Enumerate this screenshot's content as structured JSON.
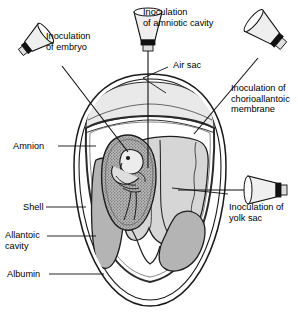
{
  "figure": {
    "type": "anatomical-diagram"
  },
  "colors": {
    "outline": "#1a1a1a",
    "air_sac_fill": "#e8e8e8",
    "yolk_sac_fill": "#d3d3d3",
    "allantoic_fill": "#b0b0b0",
    "amnion_fill": "#a8a8a8",
    "albumin_fill": "#ffffff",
    "shell_fill": "#ffffff",
    "syringe_fill": "#f0f0f0",
    "hub_fill": "#111111",
    "text": "#000000"
  },
  "labels": {
    "inoculation_embryo": {
      "lines": [
        "Inoculation",
        "of embryo"
      ],
      "line1": "Inoculation",
      "line2": "of embryo",
      "x": 46,
      "y": 33
    },
    "inoculation_amniotic": {
      "lines": [
        "Inoculation",
        "of amniotic cavity"
      ],
      "line1": "Inoculation",
      "line2": "of amniotic cavity",
      "x": 143,
      "y": 8
    },
    "air_sac": {
      "text": "Air sac",
      "x": 172,
      "y": 64
    },
    "inoculation_cam": {
      "lines": [
        "Inoculation of",
        "chorioallantoic",
        "membrane"
      ],
      "line1": "Inoculation of",
      "line2": "chorioallantoic",
      "line3": "membrane",
      "x": 231,
      "y": 85
    },
    "amnion": {
      "text": "Amnion",
      "x": 14,
      "y": 142
    },
    "inoculation_yolk": {
      "lines": [
        "Inoculation of",
        "yolk sac"
      ],
      "line1": "Inoculation of",
      "line2": "yolk sac",
      "x": 229,
      "y": 204
    },
    "shell": {
      "text": "Shell",
      "x": 24,
      "y": 203
    },
    "allantoic_cavity": {
      "lines": [
        "Allantoic",
        "cavity"
      ],
      "line1": "Allantoic",
      "line2": "cavity",
      "x": 5,
      "y": 230
    },
    "albumin": {
      "text": "Albumin",
      "x": 8,
      "y": 270
    }
  },
  "structures": [
    {
      "name": "shell",
      "label": "Shell"
    },
    {
      "name": "air-sac",
      "label": "Air sac"
    },
    {
      "name": "amnion",
      "label": "Amnion"
    },
    {
      "name": "yolk-sac",
      "label": "Yolk sac"
    },
    {
      "name": "allantoic-cavity",
      "label": "Allantoic cavity"
    },
    {
      "name": "albumin",
      "label": "Albumin"
    },
    {
      "name": "embryo",
      "label": "Embryo"
    },
    {
      "name": "chorioallantoic-membrane",
      "label": "Chorioallantoic membrane"
    }
  ],
  "syringes": [
    {
      "name": "syringe-embryo",
      "target": "embryo",
      "orientation": "upper-left"
    },
    {
      "name": "syringe-amniotic",
      "target": "amniotic cavity",
      "orientation": "top-vertical"
    },
    {
      "name": "syringe-chorioallantoic",
      "target": "chorioallantoic membrane",
      "orientation": "upper-right"
    },
    {
      "name": "syringe-yolk",
      "target": "yolk sac",
      "orientation": "right-horizontal"
    }
  ]
}
